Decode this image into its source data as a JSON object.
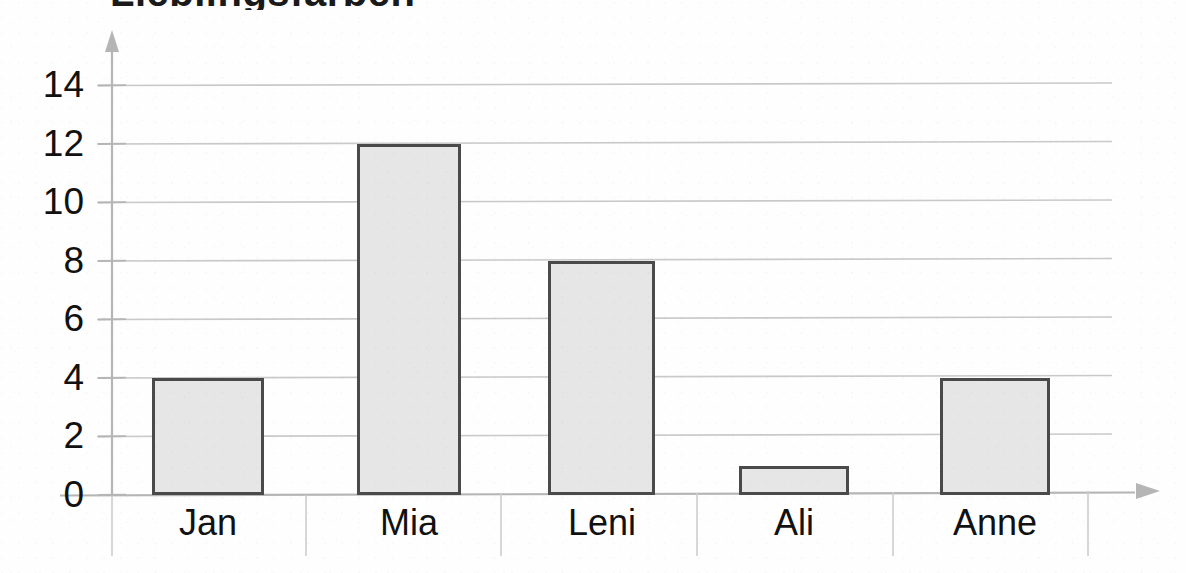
{
  "figure": {
    "title_partial": "Lieblingsfarben",
    "title_note": "cut off at top edge",
    "background_color": "#fefefe"
  },
  "axes": {
    "y_axis_name": "y-axis",
    "x_axis_name": "x-axis",
    "axis_color": "#b0b0b0",
    "gridline_color": "#c9c9c9",
    "has_y_arrow": true,
    "has_x_arrow": true
  },
  "style": {
    "bar_fill": "#e6e6e6",
    "bar_border": "#4a4a4a",
    "label_color": "#111111"
  },
  "chart_data": {
    "type": "bar",
    "title": "",
    "xlabel": "",
    "ylabel": "",
    "categories": [
      "Jan",
      "Mia",
      "Leni",
      "Ali",
      "Anne"
    ],
    "values": [
      4,
      12,
      8,
      1,
      4
    ],
    "ylim": [
      0,
      15
    ],
    "yticks": [
      0,
      2,
      4,
      6,
      8,
      10,
      12,
      14
    ],
    "ytick_labels": [
      "0",
      "2",
      "4",
      "6",
      "8",
      "10",
      "12",
      "14"
    ],
    "grid": true,
    "grid_axis": "y",
    "legend": false,
    "orientation": "vertical"
  }
}
